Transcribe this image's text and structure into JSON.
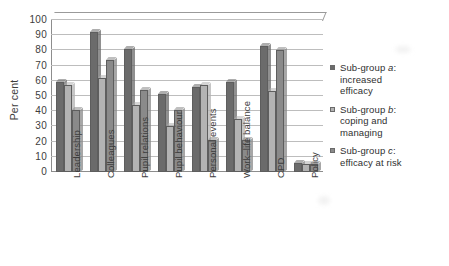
{
  "chart_data": {
    "type": "bar",
    "title": "",
    "subtitle": "",
    "xlabel": "",
    "ylabel": "Per cent",
    "ylim": [
      0,
      100
    ],
    "ytick_labels": [
      "100",
      "90",
      "80",
      "70",
      "60",
      "50",
      "40",
      "30",
      "20",
      "10",
      "0"
    ],
    "ytick_values": [
      100,
      90,
      80,
      70,
      60,
      50,
      40,
      30,
      20,
      10,
      0
    ],
    "grid": true,
    "legend_position": "right",
    "categories": [
      "Leadership",
      "Colleagues",
      "Pupil relations",
      "Pupil behaviour",
      "Personal events",
      "Work–life balance",
      "CPD",
      "Policy"
    ],
    "series": [
      {
        "name": "Sub-group a: increased efficacy",
        "short": "Sub-group a",
        "color": "#6b6b6b",
        "values": [
          59,
          92,
          81,
          51,
          56,
          59,
          83,
          6
        ]
      },
      {
        "name": "Sub-group b: coping and managing",
        "short": "Sub-group b",
        "color": "#b3b3b3",
        "values": [
          57,
          62,
          44,
          30,
          57,
          35,
          53,
          5
        ]
      },
      {
        "name": "Sub-group c: efficacy at risk",
        "short": "Sub-group c",
        "color": "#8a8a8a",
        "values": [
          41,
          74,
          54,
          41,
          21,
          21,
          80,
          5
        ]
      }
    ]
  },
  "legend": {
    "items": [
      {
        "marker": "legend-swatch",
        "line1_prefix": "Sub-group ",
        "line1_italic": "a",
        "line1_suffix": ":",
        "line2": "increased",
        "line3": "efficacy"
      },
      {
        "marker": "legend-swatch",
        "line1_prefix": "Sub-group ",
        "line1_italic": "b",
        "line1_suffix": ":",
        "line2": "coping and",
        "line3": "managing"
      },
      {
        "marker": "legend-swatch",
        "line1_prefix": "Sub-group ",
        "line1_italic": "c",
        "line1_suffix": ":",
        "line2": "efficacy at risk",
        "line3": ""
      }
    ]
  },
  "colors": {
    "series_a": "#6b6b6b",
    "series_b": "#b3b3b3",
    "series_c": "#8a8a8a",
    "grid": "#bdbdbd",
    "axis": "#8d8d8d",
    "text": "#3d3d3d",
    "background": "#ffffff"
  }
}
